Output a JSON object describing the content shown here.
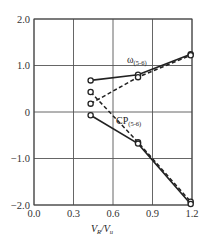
{
  "chart_data": {
    "type": "line",
    "title": "",
    "xlabel": "V_R / V_u",
    "xlabel_parts": {
      "v1": "V",
      "s1": "R",
      "slash": "/",
      "v2": "V",
      "s2": "u"
    },
    "ylabel": "",
    "xlim": [
      0.0,
      1.2
    ],
    "ylim": [
      -2.0,
      2.0
    ],
    "xticks": [
      "0.0",
      "0.3",
      "0.6",
      "0.9",
      "1.2"
    ],
    "yticks": [
      "2.0",
      "1.0",
      "0",
      "-1.0",
      "-2.0"
    ],
    "grid": true,
    "annotations": [
      {
        "text": "ω",
        "sub": "(5-6)",
        "x": 0.7,
        "y": 1.12
      },
      {
        "text": "CP",
        "sub": "(5-6)",
        "x": 0.63,
        "y": -0.18
      }
    ],
    "series": [
      {
        "name": "ω(5-6) solid",
        "style": "solid",
        "marker": "open-circle",
        "x": [
          0.43,
          0.79,
          1.19
        ],
        "y": [
          0.68,
          0.8,
          1.24
        ]
      },
      {
        "name": "ω(5-6) dashed",
        "style": "dashed",
        "marker": "open-circle",
        "x": [
          0.43,
          0.79,
          1.19
        ],
        "y": [
          0.18,
          0.75,
          1.22
        ]
      },
      {
        "name": "CP(5-6) dashed",
        "style": "dashed",
        "marker": "open-circle",
        "x": [
          0.43,
          0.79,
          1.19
        ],
        "y": [
          0.43,
          -0.65,
          -1.93
        ]
      },
      {
        "name": "CP(5-6) solid",
        "style": "solid",
        "marker": "open-circle",
        "x": [
          0.43,
          0.79,
          1.19
        ],
        "y": [
          -0.07,
          -0.68,
          -1.98
        ]
      }
    ]
  }
}
